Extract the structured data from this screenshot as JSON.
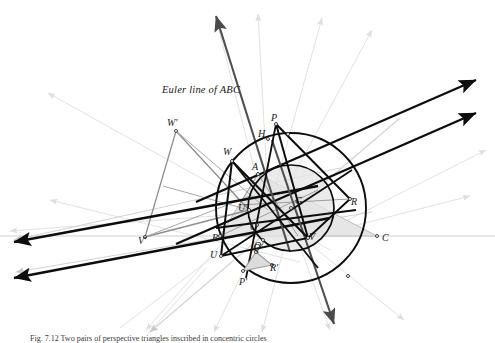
{
  "figure": {
    "kind": "euclidean-geometry-construction",
    "annotation": {
      "euler_line": "Euler line of ABC"
    },
    "caption": "Fig. 7.12 Two pairs of perspective triangles inscribed in concentric circles",
    "colors": {
      "ink": "#121212",
      "bold_line": "#0d0d0d",
      "mid_gray": "#808080",
      "light_gray": "#d8d8d8",
      "very_light_gray": "#ececec",
      "triangle_fill": "#e6e6e6",
      "small_triangle_fill": "#dcdcdc",
      "background": "#ffffff"
    },
    "points": [
      {
        "id": "A",
        "label": "A",
        "x": 258,
        "y": 174,
        "lx": 252,
        "ly": 168
      },
      {
        "id": "B",
        "label": "B",
        "x": 220,
        "y": 236,
        "lx": 213,
        "ly": 238
      },
      {
        "id": "C",
        "label": "C",
        "x": 377,
        "y": 236,
        "lx": 382,
        "ly": 238
      },
      {
        "id": "G",
        "label": "G",
        "x": 291,
        "y": 208,
        "lx": 295,
        "ly": 201
      },
      {
        "id": "O",
        "label": "O",
        "x": 257,
        "y": 225,
        "lx": 252,
        "ly": 227
      },
      {
        "id": "H",
        "label": "H",
        "x": 268,
        "y": 139,
        "lx": 259,
        "ly": 135
      },
      {
        "id": "Oprime",
        "label": "O'",
        "x": 263,
        "y": 240,
        "lx": 256,
        "ly": 245
      },
      {
        "id": "P",
        "label": "P",
        "x": 276,
        "y": 124,
        "lx": 272,
        "ly": 118
      },
      {
        "id": "R",
        "label": "R",
        "x": 350,
        "y": 199,
        "lx": 352,
        "ly": 202
      },
      {
        "id": "V",
        "label": "V",
        "x": 308,
        "y": 238,
        "lx": 310,
        "ly": 236
      },
      {
        "id": "Uprime",
        "label": "U'",
        "x": 249,
        "y": 210,
        "lx": 240,
        "ly": 209
      },
      {
        "id": "Pprime",
        "label": "P'",
        "x": 243,
        "y": 271,
        "lx": 240,
        "ly": 281
      },
      {
        "id": "Qprime",
        "label": "Q'",
        "x": 256,
        "y": 252,
        "lx": 254,
        "ly": 249
      },
      {
        "id": "Rprime",
        "label": "R'",
        "x": 272,
        "y": 265,
        "lx": 271,
        "ly": 268
      },
      {
        "id": "U",
        "label": "U",
        "x": 221,
        "y": 256,
        "lx": 211,
        "ly": 255
      },
      {
        "id": "W",
        "label": "W",
        "x": 232,
        "y": 161,
        "lx": 224,
        "ly": 152
      },
      {
        "id": "Wprime",
        "label": "W'",
        "x": 176,
        "y": 131,
        "lx": 169,
        "ly": 123
      },
      {
        "id": "Vprime",
        "label": "V'",
        "x": 145,
        "y": 237,
        "lx": 139,
        "ly": 240
      }
    ],
    "circles": [
      {
        "id": "circumcircle",
        "cx": 291,
        "cy": 208,
        "r": 75,
        "stroke": "#0d0d0d",
        "width": 1.9
      },
      {
        "id": "inner-circle",
        "cx": 291,
        "cy": 208,
        "r": 43,
        "stroke": "#0d0d0d",
        "width": 1.7
      }
    ],
    "triangles": [
      {
        "id": "ABC",
        "vertices": [
          "A",
          "B",
          "C"
        ],
        "fill": "#e6e6e6",
        "stroke": "#b5b5b5"
      },
      {
        "id": "PQR",
        "vertices": [
          "P",
          "R",
          "V"
        ],
        "stroke": "#0d0d0d"
      },
      {
        "id": "PQR-prime",
        "vertices": [
          "Pprime",
          "Qprime",
          "Rprime"
        ],
        "fill": "#dcdcdc",
        "stroke": "#9a9a9a"
      },
      {
        "id": "UVW",
        "vertices": [
          "U",
          "V",
          "W"
        ],
        "stroke": "#0d0d0d"
      },
      {
        "id": "UVW-prime",
        "vertices": [
          "Uprime",
          "Vprime",
          "Wprime"
        ],
        "stroke": "#8a8a8a"
      }
    ]
  }
}
